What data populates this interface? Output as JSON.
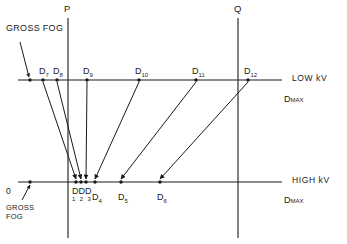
{
  "figure": {
    "type": "technical-line-diagram",
    "title_visible": "",
    "vertical_guides": [
      {
        "name": "P",
        "label": "P",
        "x": 68,
        "y_top": 18,
        "y_bottom": 238
      },
      {
        "name": "Q",
        "label": "Q",
        "x": 238,
        "y_top": 18,
        "y_bottom": 238
      }
    ],
    "axes": [
      {
        "id": "low-kv",
        "label": "LOW kV",
        "end_label_main": "D",
        "end_label_sub": "MAX",
        "y": 80,
        "x_start": 18,
        "x_end": 282,
        "gross_fog_label": "GROSS FOG",
        "points": [
          {
            "id": "fog",
            "label": "",
            "sub": "",
            "x": 30
          },
          {
            "id": "d7",
            "label": "D",
            "sub": "7",
            "x": 43
          },
          {
            "id": "d8",
            "label": "D",
            "sub": "8",
            "x": 57
          },
          {
            "id": "d9",
            "label": "D",
            "sub": "9",
            "x": 87
          },
          {
            "id": "d10",
            "label": "D",
            "sub": "10",
            "x": 139
          },
          {
            "id": "d11",
            "label": "D",
            "sub": "11",
            "x": 196
          },
          {
            "id": "d12",
            "label": "D",
            "sub": "12",
            "x": 248
          }
        ]
      },
      {
        "id": "high-kv",
        "label": "HIGH kV",
        "end_label_main": "D",
        "end_label_sub": "MAX",
        "y": 182,
        "x_start": 18,
        "x_end": 282,
        "zero_label": "0",
        "gross_fog_label_line1": "GROSS",
        "gross_fog_label_line2": "FOG",
        "cluster_label": "DDD",
        "cluster_subs": "1 2 3",
        "points": [
          {
            "id": "fog",
            "label": "",
            "sub": "",
            "x": 30
          },
          {
            "id": "d1",
            "label": "D",
            "sub": "1",
            "x": 76
          },
          {
            "id": "d2",
            "label": "D",
            "sub": "2",
            "x": 81
          },
          {
            "id": "d3",
            "label": "D",
            "sub": "3",
            "x": 86
          },
          {
            "id": "d4",
            "label": "D",
            "sub": "4",
            "x": 95
          },
          {
            "id": "d5",
            "label": "D",
            "sub": "5",
            "x": 121
          },
          {
            "id": "d6",
            "label": "D",
            "sub": "6",
            "x": 160
          }
        ]
      }
    ],
    "mapping_arrows": [
      {
        "from": "d7",
        "from_x": 43,
        "to": "d1",
        "to_x": 76
      },
      {
        "from": "d8",
        "from_x": 57,
        "to": "d2",
        "to_x": 81
      },
      {
        "from": "d9",
        "from_x": 87,
        "to": "d3",
        "to_x": 86
      },
      {
        "from": "d10",
        "from_x": 139,
        "to": "d4",
        "to_x": 95
      },
      {
        "from": "d11",
        "from_x": 196,
        "to": "d5",
        "to_x": 121
      },
      {
        "from": "d12",
        "from_x": 248,
        "to": "d6",
        "to_x": 160
      }
    ],
    "fog_callout_top": {
      "text": "GROSS FOG",
      "text_x": 6,
      "text_y": 32,
      "arrow_from_x": 20,
      "arrow_from_y": 42,
      "arrow_to_x": 29,
      "arrow_to_y": 77
    },
    "fog_callout_bottom": {
      "line1": "GROSS",
      "line2": "FOG",
      "text_x": 6,
      "text_y": 203,
      "arrow_from_x": 22,
      "arrow_from_y": 200,
      "arrow_to_x": 30,
      "arrow_to_y": 185
    },
    "colors": {
      "ink": "#1a1a1a",
      "background": "#ffffff"
    }
  }
}
